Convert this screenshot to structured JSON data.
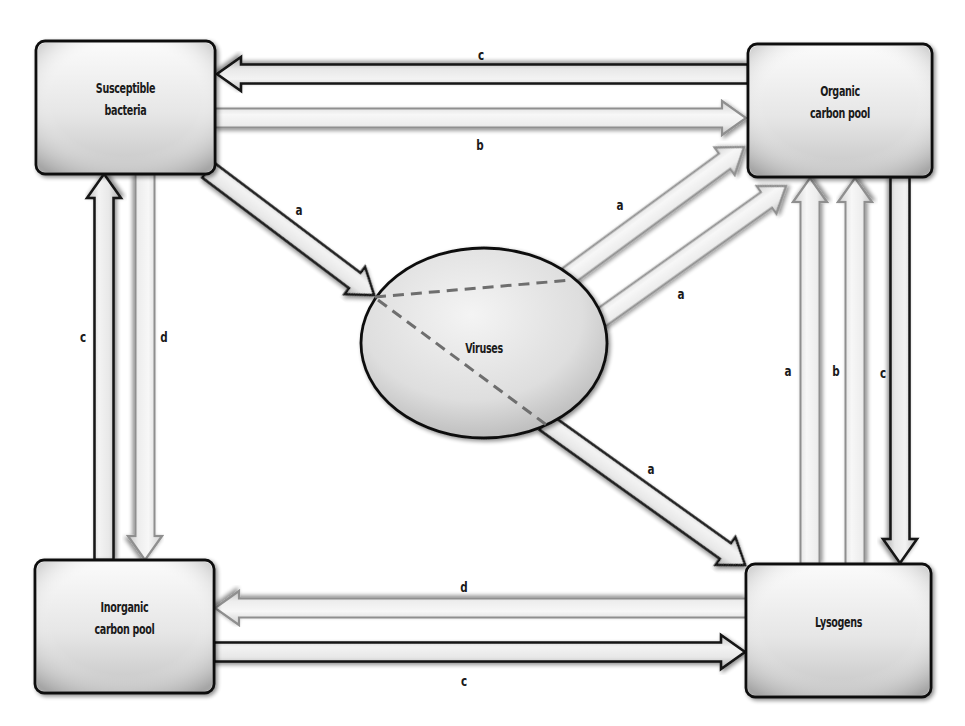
{
  "diagram": {
    "width": 965,
    "height": 726,
    "colors": {
      "background": "#ffffff",
      "box_fill_light": "#f7f7f7",
      "box_fill_dark": "#c9c9c9",
      "box_stroke": "#111111",
      "arrow_dark_stroke": "#141414",
      "arrow_light_stroke": "#8f8f8f",
      "arrow_fill_light": "#f2f2f2",
      "arrow_fill_dark": "#bdbdbd",
      "dash": "#6e6e6e",
      "text": "#1a1a1a"
    },
    "nodes": [
      {
        "id": "susceptible",
        "name": "node-susceptible-bacteria",
        "shape": "rect",
        "x": 36,
        "y": 41,
        "w": 179,
        "h": 133,
        "lines": [
          "Susceptible",
          "bacteria"
        ]
      },
      {
        "id": "organic",
        "name": "node-organic-carbon-pool",
        "shape": "rect",
        "x": 748,
        "y": 44,
        "w": 184,
        "h": 133,
        "lines": [
          "Organic",
          "carbon pool"
        ]
      },
      {
        "id": "inorganic",
        "name": "node-inorganic-carbon-pool",
        "shape": "rect",
        "x": 35,
        "y": 560,
        "w": 179,
        "h": 133,
        "lines": [
          "Inorganic",
          "carbon pool"
        ]
      },
      {
        "id": "lysogens",
        "name": "node-lysogens",
        "shape": "rect",
        "x": 746,
        "y": 564,
        "w": 185,
        "h": 133,
        "lines": [
          "Lysogens"
        ]
      },
      {
        "id": "viruses",
        "name": "node-viruses",
        "shape": "ellipse",
        "cx": 484,
        "cy": 343,
        "rx": 123,
        "ry": 95,
        "lines": [
          "Viruses"
        ]
      }
    ],
    "dashed_lines": [
      {
        "x1": 375,
        "y1": 297,
        "x2": 572,
        "y2": 280
      },
      {
        "x1": 378,
        "y1": 300,
        "x2": 548,
        "y2": 426
      }
    ],
    "edges": [
      {
        "name": "edge-organic-to-susceptible-c",
        "from": "organic",
        "to": "susceptible",
        "label": "c",
        "style": "dark",
        "x1": 748,
        "y1": 74,
        "x2": 217,
        "y2": 74,
        "lx": 481,
        "ly": 60
      },
      {
        "name": "edge-susceptible-to-organic-b",
        "from": "susceptible",
        "to": "organic",
        "label": "b",
        "style": "light",
        "x1": 215,
        "y1": 118,
        "x2": 746,
        "y2": 118,
        "lx": 480,
        "ly": 150
      },
      {
        "name": "edge-susceptible-to-viruses-a",
        "from": "susceptible",
        "to": "viruses",
        "label": "a",
        "style": "dark",
        "x1": 208,
        "y1": 170,
        "x2": 374,
        "y2": 295,
        "lx": 299,
        "ly": 215
      },
      {
        "name": "edge-viruses-to-organic-a1",
        "from": "viruses",
        "to": "organic",
        "label": "a",
        "style": "light",
        "x1": 568,
        "y1": 276,
        "x2": 744,
        "y2": 147,
        "lx": 620,
        "ly": 210
      },
      {
        "name": "edge-viruses-to-organic-a2",
        "from": "viruses",
        "to": "organic",
        "label": "a",
        "style": "light",
        "x1": 598,
        "y1": 320,
        "x2": 786,
        "y2": 186,
        "lx": 681,
        "ly": 299
      },
      {
        "name": "edge-viruses-to-lysogens-a",
        "from": "viruses",
        "to": "lysogens",
        "label": "a",
        "style": "dark",
        "x1": 545,
        "y1": 422,
        "x2": 745,
        "y2": 565,
        "lx": 651,
        "ly": 474
      },
      {
        "name": "edge-inorganic-to-susceptible-c",
        "from": "inorganic",
        "to": "susceptible",
        "label": "c",
        "style": "dark",
        "x1": 104,
        "y1": 560,
        "x2": 104,
        "y2": 174,
        "lx": 83,
        "ly": 342
      },
      {
        "name": "edge-susceptible-to-inorganic-d",
        "from": "susceptible",
        "to": "inorganic",
        "label": "d",
        "style": "light",
        "x1": 145,
        "y1": 174,
        "x2": 145,
        "y2": 560,
        "lx": 164,
        "ly": 342
      },
      {
        "name": "edge-lysogens-to-organic-a",
        "from": "lysogens",
        "to": "organic",
        "label": "a",
        "style": "light",
        "x1": 810,
        "y1": 564,
        "x2": 810,
        "y2": 178,
        "lx": 788,
        "ly": 376
      },
      {
        "name": "edge-lysogens-to-organic-b",
        "from": "lysogens",
        "to": "organic",
        "label": "b",
        "style": "light",
        "x1": 855,
        "y1": 564,
        "x2": 855,
        "y2": 178,
        "lx": 836,
        "ly": 376
      },
      {
        "name": "edge-organic-to-lysogens-c",
        "from": "organic",
        "to": "lysogens",
        "label": "c",
        "style": "dark",
        "x1": 900,
        "y1": 177,
        "x2": 900,
        "y2": 563,
        "lx": 883,
        "ly": 378
      },
      {
        "name": "edge-lysogens-to-inorganic-d",
        "from": "lysogens",
        "to": "inorganic",
        "label": "d",
        "style": "light",
        "x1": 746,
        "y1": 608,
        "x2": 215,
        "y2": 608,
        "lx": 464,
        "ly": 592
      },
      {
        "name": "edge-inorganic-to-lysogens-c",
        "from": "inorganic",
        "to": "lysogens",
        "label": "c",
        "style": "dark",
        "x1": 214,
        "y1": 652,
        "x2": 745,
        "y2": 652,
        "lx": 464,
        "ly": 686
      }
    ],
    "arrow_geometry": {
      "shaft_width": 19,
      "head_width": 34,
      "head_length": 24
    }
  }
}
